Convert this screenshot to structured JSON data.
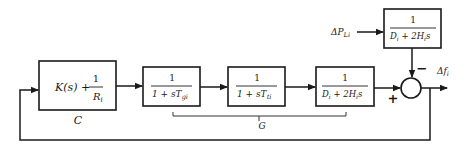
{
  "diagram": {
    "type": "control-block-diagram",
    "blocks": [
      {
        "id": "controller",
        "expr_main": "K(s) + ",
        "num": "1",
        "den": "R",
        "den_sub": "i",
        "label": "C"
      },
      {
        "id": "governor",
        "num": "1",
        "den": "1 + sT",
        "den_sub": "gi"
      },
      {
        "id": "turbine",
        "num": "1",
        "den": "1 + sT",
        "den_sub": "ti"
      },
      {
        "id": "plant",
        "num": "1",
        "den_a": "D",
        "den_a_sub": "i",
        "den_b": " + 2H",
        "den_b_sub": "i",
        "den_c": "s"
      },
      {
        "id": "load-plant",
        "num": "1",
        "den_a": "D",
        "den_a_sub": "i",
        "den_b": " + 2H",
        "den_b_sub": "i",
        "den_c": "s"
      }
    ],
    "group_label": "G",
    "input": {
      "symbol": "ΔP",
      "sub": "Li"
    },
    "output": {
      "symbol": "Δf",
      "sub": "i"
    },
    "sum_signs": {
      "plus": "+",
      "minus": "−"
    }
  }
}
